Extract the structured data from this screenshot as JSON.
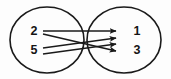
{
  "diagram": {
    "type": "mapping-diagram",
    "title": "",
    "style": {
      "background_color": "#fdfdfd",
      "stroke_color": "#1a1a1a",
      "label_color": "#141414"
    },
    "sets": [
      {
        "id": "domain",
        "role": "domain",
        "side": "left",
        "center_x": 47,
        "center_y": 40,
        "radius_x": 37,
        "radius_y": 33,
        "elements": [
          {
            "id": "d2",
            "label": "2",
            "x": 34,
            "y": 32
          },
          {
            "id": "d5",
            "label": "5",
            "x": 34,
            "y": 51
          }
        ]
      },
      {
        "id": "codomain",
        "role": "codomain",
        "side": "right",
        "center_x": 124,
        "center_y": 40,
        "radius_x": 37,
        "radius_y": 33,
        "elements": [
          {
            "id": "c1",
            "label": "1",
            "x": 137,
            "y": 32
          },
          {
            "id": "c3",
            "label": "3",
            "x": 137,
            "y": 51
          }
        ]
      }
    ],
    "arrows": [
      {
        "id": "a1",
        "from": "2",
        "to": "1",
        "x1": 43,
        "y1": 31,
        "x2": 117,
        "y2": 31,
        "shape": "horizontal"
      },
      {
        "id": "a2",
        "from": "2",
        "to": "3",
        "x1": 43,
        "y1": 34,
        "x2": 117,
        "y2": 51,
        "shape": "descending"
      },
      {
        "id": "a3",
        "from": "5",
        "to": "1",
        "x1": 43,
        "y1": 48,
        "x2": 117,
        "y2": 38,
        "shape": "ascending"
      },
      {
        "id": "a4",
        "from": "5",
        "to": "3",
        "x1": 43,
        "y1": 54,
        "x2": 117,
        "y2": 44,
        "shape": "horizontal"
      }
    ],
    "arrowhead_count": 4,
    "crossing": true
  }
}
